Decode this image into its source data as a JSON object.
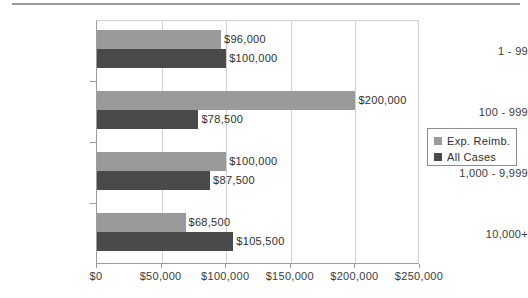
{
  "chart_data": {
    "type": "bar",
    "orientation": "horizontal",
    "title": "",
    "xlabel": "",
    "ylabel": "",
    "categories": [
      "1 - 99",
      "100 - 999",
      "1,000 - 9,999",
      "10,000+"
    ],
    "series": [
      {
        "name": "Exp. Reimb.",
        "color": "#9a9a9a",
        "values": [
          96000,
          200000,
          100000,
          68500
        ],
        "labels": [
          "$96,000",
          "$200,000",
          "$100,000",
          "$68,500"
        ]
      },
      {
        "name": "All Cases",
        "color": "#4a4a4a",
        "values": [
          100000,
          78500,
          87500,
          105500
        ],
        "labels": [
          "$100,000",
          "$78,500",
          "$87,500",
          "$105,500"
        ]
      }
    ],
    "xlim": [
      0,
      250000
    ],
    "xticks": [
      0,
      50000,
      100000,
      150000,
      200000,
      250000
    ],
    "xtick_labels": [
      "$0",
      "$50,000",
      "$100,000",
      "$150,000",
      "$200,000",
      "$250,000"
    ],
    "grid": true,
    "legend_position": "right"
  },
  "legend": {
    "entries": [
      {
        "label": "Exp. Reimb."
      },
      {
        "label": "All Cases"
      }
    ]
  }
}
